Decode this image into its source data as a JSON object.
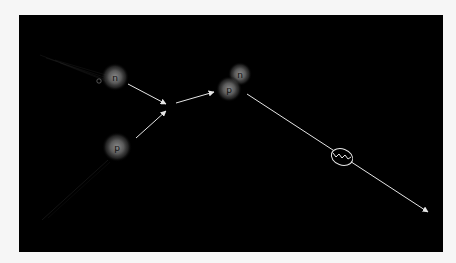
{
  "diagram": {
    "background_color": "#000000",
    "page_color": "#f6f6f6",
    "line_color": "#e6e6e6",
    "particles": [
      {
        "id": "neutron-incoming",
        "label": "n",
        "cx": 115,
        "cy": 77
      },
      {
        "id": "proton-incoming",
        "label": "p",
        "cx": 117,
        "cy": 147
      },
      {
        "id": "deuteron-neutron",
        "label": "n",
        "cx": 240,
        "cy": 74
      },
      {
        "id": "deuteron-proton",
        "label": "p",
        "cx": 229,
        "cy": 89
      }
    ],
    "photon": {
      "label": "gamma photon",
      "cx": 342,
      "cy": 157
    }
  }
}
